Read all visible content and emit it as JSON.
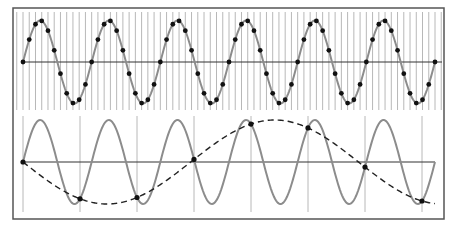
{
  "figure": {
    "colors": {
      "frame": "#555555",
      "sample_lines": "#b8b8b8",
      "signal": "#8c8c8c",
      "axis": "#333333",
      "samples": "#111111",
      "alias": "#222222",
      "background": "#ffffff"
    },
    "frame": {
      "x": 13,
      "y": 8,
      "w": 431,
      "h": 211
    },
    "top_panel": {
      "axis_y": 62,
      "amplitude": 41.5,
      "x_start": 23,
      "x_end": 435,
      "cycles": 6,
      "samples_per_cycle": 11,
      "grid_x_start": 16,
      "grid_y_top": 12,
      "grid_y_bottom": 110
    },
    "bottom_panel": {
      "axis_y": 162,
      "amplitude": 42,
      "x_start": 23,
      "x_end": 435,
      "cycles": 6,
      "sample_x": [
        23,
        80,
        137,
        194,
        251,
        308,
        365,
        422
      ],
      "grid_y_top": 116,
      "grid_y_bottom": 212,
      "alias_style": "dashed"
    }
  }
}
